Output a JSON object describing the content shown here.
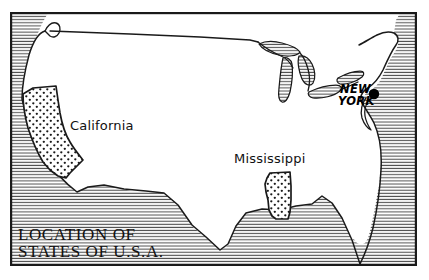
{
  "figure": {
    "kind": "line-drawing-map",
    "width": 429,
    "height": 280,
    "background_color": "#ffffff",
    "ink_color": "#1a1a1a",
    "frame": {
      "name": "map-border-frame",
      "x": 10,
      "y": 12,
      "width": 407,
      "height": 254,
      "stroke_width": 2.2
    }
  },
  "title": {
    "line1": "LOCATION OF",
    "line2": "STATES OF U.S.A."
  },
  "state_labels": [
    {
      "name": "california",
      "text": "California",
      "x": 70,
      "y": 130
    },
    {
      "name": "mississippi",
      "text": "Mississippi",
      "x": 234,
      "y": 163
    }
  ],
  "city_labels": [
    {
      "name": "new-york",
      "line1": "NEW",
      "line2": "YORK",
      "x": 340,
      "y": 93,
      "marker_x": 374,
      "marker_y": 94,
      "marker_radius": 5.2
    }
  ],
  "legend": {
    "stipple_fill": "highlighted states shown with dot stipple pattern",
    "hatch_fill": "ocean and lake water shown with horizontal hatch lines",
    "stipple_color": "#1a1a1a",
    "hatch_color": "#555555"
  },
  "highlighted_states": [
    {
      "name": "california",
      "fill": "stipple"
    },
    {
      "name": "mississippi",
      "fill": "stipple"
    }
  ],
  "water_bodies": [
    {
      "name": "pacific-ocean",
      "fill": "hatch"
    },
    {
      "name": "atlantic-ocean",
      "fill": "hatch"
    },
    {
      "name": "gulf-of-mexico",
      "fill": "hatch"
    },
    {
      "name": "great-lakes",
      "fill": "hatch"
    }
  ]
}
